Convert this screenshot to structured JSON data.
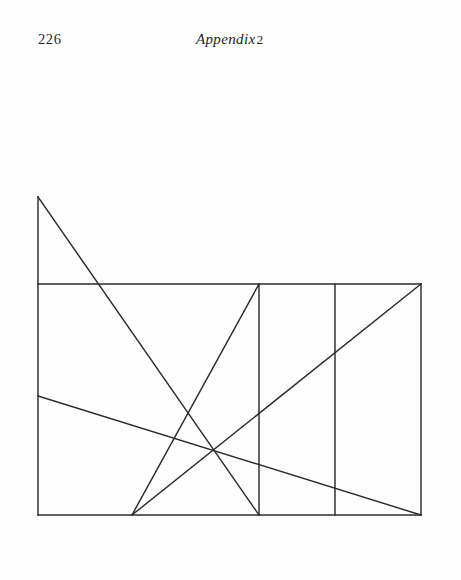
{
  "page": {
    "background_color": "#fefefe",
    "width": 461,
    "height": 580
  },
  "running_head": {
    "folio": "226",
    "title_italic": "Appendix",
    "title_number": "2"
  },
  "figure": {
    "caption": "",
    "stroke_color": "#2b2b2b",
    "stroke_width": 1.45,
    "frame": {
      "left_x": 38,
      "right_x": 421,
      "rail_y": 284,
      "bottom_y": 515
    },
    "apex": {
      "x": 38,
      "y": 197
    },
    "vertical_dividers": [
      259,
      335
    ],
    "points": {
      "apex": [
        38,
        197
      ],
      "rail_left": [
        38,
        284
      ],
      "rail_right": [
        421,
        284
      ],
      "bottom_left": [
        38,
        515
      ],
      "bottom_right": [
        421,
        515
      ],
      "bottom_node": [
        132,
        515
      ],
      "bottom_mid_node": [
        259,
        515
      ],
      "left_edge_node": [
        38,
        396
      ],
      "divider_one_top": [
        259,
        284
      ],
      "divider_two_top": [
        335,
        284
      ]
    },
    "segments": [
      {
        "name": "left-edge-upper",
        "x1": 38,
        "y1": 197,
        "x2": 38,
        "y2": 284
      },
      {
        "name": "left-edge-lower",
        "x1": 38,
        "y1": 284,
        "x2": 38,
        "y2": 515
      },
      {
        "name": "right-edge",
        "x1": 421,
        "y1": 284,
        "x2": 421,
        "y2": 515
      },
      {
        "name": "horizontal-rail",
        "x1": 38,
        "y1": 284,
        "x2": 421,
        "y2": 284
      },
      {
        "name": "base-line",
        "x1": 38,
        "y1": 515,
        "x2": 421,
        "y2": 515
      },
      {
        "name": "divider-one",
        "x1": 259,
        "y1": 284,
        "x2": 259,
        "y2": 515
      },
      {
        "name": "divider-two",
        "x1": 335,
        "y1": 284,
        "x2": 335,
        "y2": 515
      },
      {
        "name": "apex-diagonal",
        "x1": 38,
        "y1": 197,
        "x2": 259,
        "y2": 515
      },
      {
        "name": "rising-diagonal-short",
        "x1": 132,
        "y1": 515,
        "x2": 259,
        "y2": 284
      },
      {
        "name": "rising-diagonal-long",
        "x1": 132,
        "y1": 515,
        "x2": 421,
        "y2": 284
      },
      {
        "name": "shallow-descending",
        "x1": 38,
        "y1": 396,
        "x2": 421,
        "y2": 515
      }
    ]
  }
}
